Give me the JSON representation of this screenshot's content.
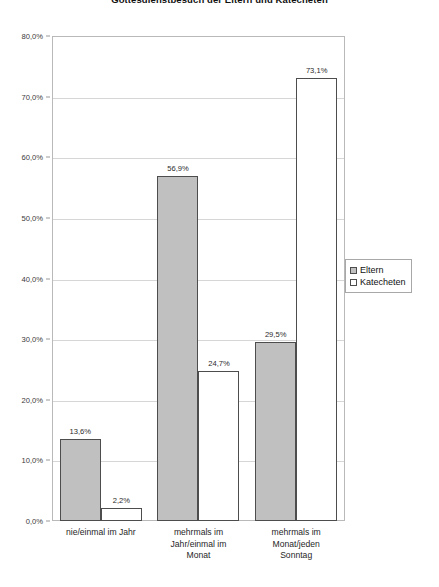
{
  "chart_data": {
    "type": "bar",
    "title": "Gottesdienstbesuch der Eltern und Katecheten",
    "xlabel": "",
    "ylabel": "",
    "ylim": [
      0,
      80
    ],
    "grid": true,
    "legend_position": "right",
    "categories": [
      "nie/einmal im Jahr",
      "mehrmals im Jahr/einmal im Monat",
      "mehrmals im Monat/jeden Sonntag"
    ],
    "category_lines": [
      [
        "nie/einmal im Jahr"
      ],
      [
        "mehrmals im",
        "Jahr/einmal im",
        "Monat"
      ],
      [
        "mehrmals im",
        "Monat/jeden",
        "Sonntag"
      ]
    ],
    "series": [
      {
        "name": "Eltern",
        "color": "#c0c0c0",
        "values": [
          13.6,
          56.9,
          29.5
        ],
        "labels": [
          "13,6%",
          "56,9%",
          "29,5%"
        ]
      },
      {
        "name": "Katecheten",
        "color": "#ffffff",
        "values": [
          2.2,
          24.7,
          73.1
        ],
        "labels": [
          "2,2%",
          "24,7%",
          "73,1%"
        ]
      }
    ],
    "yticks": [
      0,
      10,
      20,
      30,
      40,
      50,
      60,
      70,
      80
    ],
    "ytick_labels": [
      "0,0%",
      "10,0%",
      "20,0%",
      "30,0%",
      "40,0%",
      "50,0%",
      "60,0%",
      "70,0%",
      "80,0%"
    ]
  },
  "legend": {
    "items": [
      {
        "label": "Eltern"
      },
      {
        "label": "Katecheten"
      }
    ]
  }
}
